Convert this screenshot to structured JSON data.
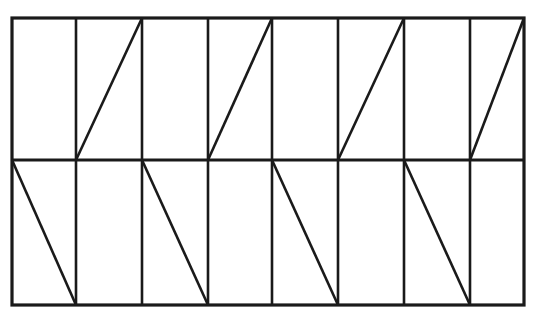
{
  "figure": {
    "canvas": {
      "width": 534,
      "height": 318,
      "background": "#ffffff"
    },
    "stroke": {
      "color": "#1a1a1a",
      "border_width": 3.2,
      "divider_width": 2.6,
      "diagonal_width": 2.6
    },
    "rect": {
      "x0": 12,
      "y0": 18,
      "x1": 524,
      "y1": 305
    },
    "rows": {
      "count": 2,
      "midline_y": 160,
      "top": {
        "y0": 18,
        "y1": 160
      },
      "bottom": {
        "y0": 160,
        "y1": 305
      }
    },
    "columns": {
      "count": 8,
      "edges": [
        12,
        76,
        142,
        208,
        272,
        338,
        404,
        470,
        524
      ],
      "dividers_x": [
        76,
        142,
        208,
        272,
        338,
        404,
        470
      ]
    },
    "diagonals": {
      "top_row": {
        "direction": "bottom-left-to-top-right",
        "glyph": "/",
        "cell_indices": [
          2,
          4,
          6,
          8
        ],
        "segments": [
          {
            "x1": 76,
            "y1": 160,
            "x2": 142,
            "y2": 18
          },
          {
            "x1": 208,
            "y1": 160,
            "x2": 272,
            "y2": 18
          },
          {
            "x1": 338,
            "y1": 160,
            "x2": 404,
            "y2": 18
          },
          {
            "x1": 470,
            "y1": 160,
            "x2": 524,
            "y2": 18
          }
        ]
      },
      "bottom_row": {
        "direction": "top-left-to-bottom-right",
        "glyph": "\\",
        "cell_indices": [
          1,
          3,
          5,
          7
        ],
        "segments": [
          {
            "x1": 12,
            "y1": 160,
            "x2": 76,
            "y2": 305
          },
          {
            "x1": 142,
            "y1": 160,
            "x2": 208,
            "y2": 305
          },
          {
            "x1": 272,
            "y1": 160,
            "x2": 338,
            "y2": 305
          },
          {
            "x1": 404,
            "y1": 160,
            "x2": 470,
            "y2": 305
          }
        ]
      }
    }
  }
}
